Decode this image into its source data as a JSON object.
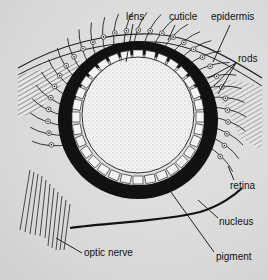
{
  "diagram": {
    "labels": [
      {
        "id": "lens",
        "text": "lens",
        "x": 126,
        "y": 12
      },
      {
        "id": "cuticle",
        "text": "cuticle",
        "x": 169,
        "y": 12
      },
      {
        "id": "epidermis",
        "text": "epidermis",
        "x": 211,
        "y": 12
      },
      {
        "id": "rods",
        "text": "rods",
        "x": 236,
        "y": 59
      },
      {
        "id": "retina",
        "text": "retina",
        "x": 230,
        "y": 182
      },
      {
        "id": "nucleus",
        "text": "nucleus",
        "x": 219,
        "y": 218
      },
      {
        "id": "pigment",
        "text": "pigment",
        "x": 216,
        "y": 252
      },
      {
        "id": "optic-nerve",
        "text": "optic nerve",
        "x": 83,
        "y": 253
      }
    ]
  }
}
